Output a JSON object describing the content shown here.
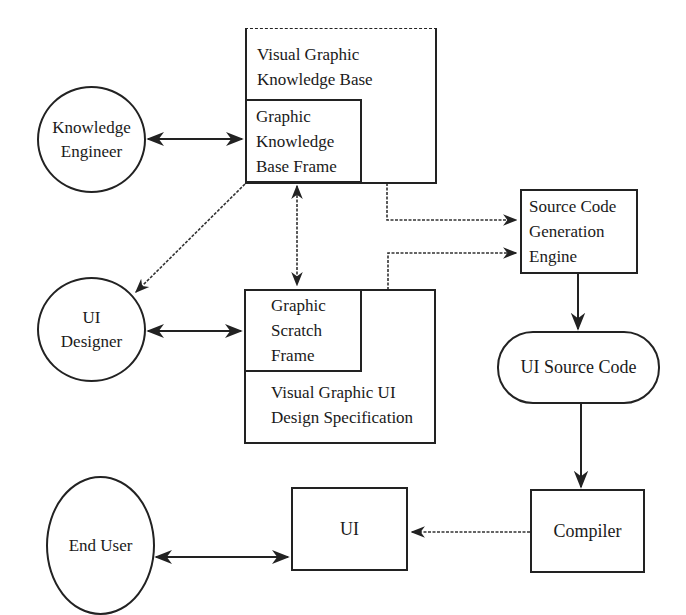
{
  "diagram": {
    "nodes": {
      "knowledge_engineer": {
        "label": "Knowledge\nEngineer",
        "shape": "circle"
      },
      "ui_designer": {
        "label": "UI\nDesigner",
        "shape": "circle"
      },
      "end_user": {
        "label": "End User",
        "shape": "ellipse"
      },
      "visual_graphic_kb": {
        "label": "Visual Graphic\nKnowledge Base",
        "shape": "box"
      },
      "graphic_kb_frame": {
        "label": "Graphic\nKnowledge\nBase Frame",
        "shape": "box"
      },
      "graphic_scratch_frame": {
        "label": "Graphic\nScratch\nFrame",
        "shape": "box"
      },
      "visual_graphic_ui_spec": {
        "label": "Visual Graphic UI\nDesign Specification",
        "shape": "box"
      },
      "source_code_gen_engine": {
        "label": "Source Code\nGeneration\nEngine",
        "shape": "box"
      },
      "ui_source_code": {
        "label": "UI Source Code",
        "shape": "rounded"
      },
      "compiler": {
        "label": "Compiler",
        "shape": "box"
      },
      "ui": {
        "label": "UI",
        "shape": "box"
      }
    },
    "edges": [
      {
        "from": "knowledge_engineer",
        "to": "graphic_kb_frame",
        "style": "solid",
        "direction": "both"
      },
      {
        "from": "ui_designer",
        "to": "graphic_scratch_frame",
        "style": "solid",
        "direction": "both"
      },
      {
        "from": "graphic_kb_frame",
        "to": "graphic_scratch_frame",
        "style": "dashed",
        "direction": "both"
      },
      {
        "from": "graphic_kb_frame",
        "to": "ui_designer",
        "style": "dashed",
        "direction": "forward"
      },
      {
        "from": "visual_graphic_kb",
        "to": "source_code_gen_engine",
        "style": "dashed",
        "direction": "forward"
      },
      {
        "from": "visual_graphic_ui_spec",
        "to": "source_code_gen_engine",
        "style": "dashed",
        "direction": "forward"
      },
      {
        "from": "source_code_gen_engine",
        "to": "ui_source_code",
        "style": "solid",
        "direction": "forward"
      },
      {
        "from": "ui_source_code",
        "to": "compiler",
        "style": "solid",
        "direction": "forward"
      },
      {
        "from": "compiler",
        "to": "ui",
        "style": "dashed",
        "direction": "forward"
      },
      {
        "from": "end_user",
        "to": "ui",
        "style": "solid",
        "direction": "both"
      }
    ]
  },
  "colors": {
    "line": "#222222",
    "background": "#ffffff"
  }
}
